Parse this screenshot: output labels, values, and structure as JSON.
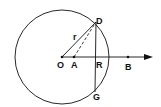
{
  "diagram": {
    "circle": {
      "cx": 62,
      "cy": 57,
      "r": 47
    },
    "labels": {
      "O": "O",
      "A": "A",
      "R": "R",
      "B": "B",
      "D": "D",
      "G": "G",
      "r": "r"
    },
    "colors": {
      "stroke": "#111111",
      "background": "#ffffff"
    }
  }
}
